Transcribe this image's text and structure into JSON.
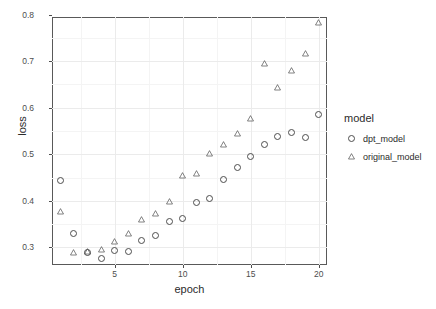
{
  "chart_data": {
    "type": "scatter",
    "title": "",
    "xlabel": "epoch",
    "ylabel": "loss",
    "xlim": [
      0.4,
      20.6
    ],
    "ylim": [
      0.262,
      0.795
    ],
    "grid": true,
    "legend_position": "right",
    "legend_title": "model",
    "x_ticks": [
      5,
      10,
      15,
      20
    ],
    "x_tick_labels": [
      "5",
      "10",
      "15",
      "20"
    ],
    "x_minor_ticks": [
      2.5,
      7.5,
      12.5,
      17.5
    ],
    "y_ticks": [
      0.3,
      0.4,
      0.5,
      0.6,
      0.7,
      0.8
    ],
    "y_tick_labels": [
      "0.3",
      "0.4",
      "0.5",
      "0.6",
      "0.7",
      "0.8"
    ],
    "y_minor_ticks": [
      0.35,
      0.45,
      0.55,
      0.65,
      0.75
    ],
    "x": [
      1,
      2,
      3,
      4,
      5,
      6,
      7,
      8,
      9,
      10,
      11,
      12,
      13,
      14,
      15,
      16,
      17,
      18,
      19,
      20
    ],
    "series": [
      {
        "name": "dpt_model",
        "marker": "circle",
        "color": "#4d4d4d",
        "values": [
          0.443,
          0.33,
          0.289,
          0.277,
          0.294,
          0.292,
          0.314,
          0.325,
          0.356,
          0.362,
          0.397,
          0.405,
          0.445,
          0.472,
          0.495,
          0.521,
          0.539,
          0.547,
          0.535,
          0.586
        ]
      },
      {
        "name": "original_model",
        "marker": "triangle",
        "color": "#4d4d4d",
        "values": [
          0.377,
          0.288,
          0.29,
          0.296,
          0.312,
          0.329,
          0.36,
          0.373,
          0.399,
          0.455,
          0.459,
          0.502,
          0.521,
          0.544,
          0.577,
          0.694,
          0.644,
          0.679,
          0.717,
          0.784
        ]
      }
    ]
  },
  "legend": {
    "title": "model",
    "entries": [
      {
        "label": "dpt_model",
        "marker": "circle"
      },
      {
        "label": "original_model",
        "marker": "triangle"
      }
    ]
  },
  "axes": {
    "x_title": "epoch",
    "y_title": "loss"
  },
  "colors": {
    "marker": "#4d4d4d",
    "panel_border": "#595959",
    "grid_major": "#ebebeb",
    "grid_minor": "#f4f4f4",
    "text": "#2b2b2b",
    "background": "#ffffff"
  }
}
